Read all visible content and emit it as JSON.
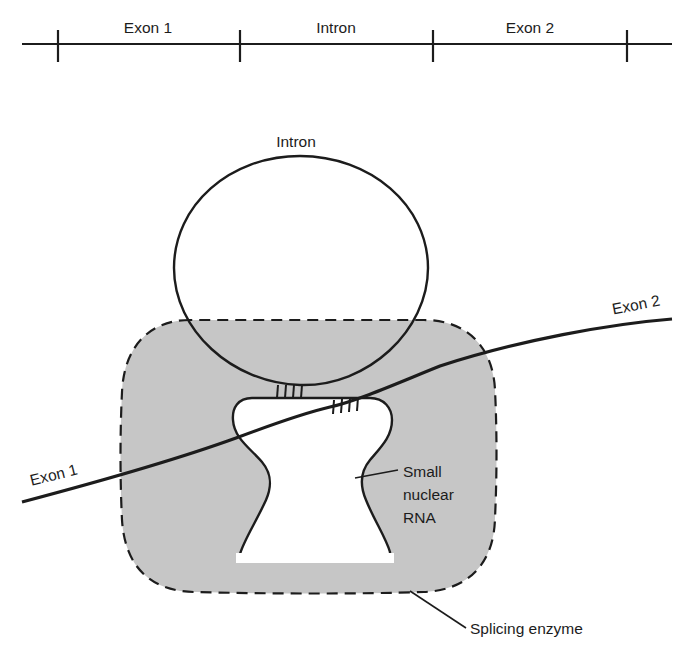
{
  "figure": {
    "colors": {
      "stroke": "#1c1c1c",
      "enzyme_fill": "#c6c6c6",
      "cavity_fill": "#ffffff",
      "background": "#ffffff",
      "text": "#1c1c1c"
    }
  },
  "top_diagram": {
    "name": "pre-mRNA linear map",
    "segments": [
      {
        "label": "Exon 1"
      },
      {
        "label": "Intron"
      },
      {
        "label": "Exon 2"
      }
    ],
    "tick_count": 4,
    "axis": {
      "x_start": 22,
      "x_end": 672,
      "y": 44
    },
    "tick_positions": [
      58,
      240,
      433,
      627
    ]
  },
  "main_diagram": {
    "loop_label": "Intron",
    "exon_left_label": "Exon 1",
    "exon_right_label": "Exon 2",
    "snrna_label_lines": [
      "Small",
      "nuclear",
      "RNA"
    ],
    "snrna_label": "Small nuclear RNA",
    "enzyme_label": "Splicing enzyme",
    "base_pair_groups": [
      {
        "name": "left-base-pairs",
        "ticks": 4
      },
      {
        "name": "right-base-pairs",
        "ticks": 4
      }
    ]
  }
}
